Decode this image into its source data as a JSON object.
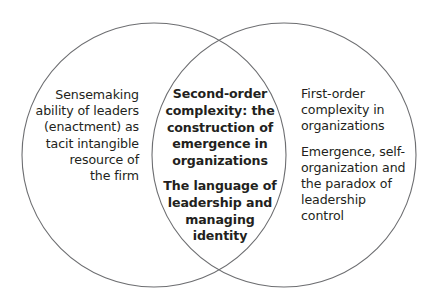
{
  "diagram": {
    "type": "venn",
    "circles": [
      {
        "id": "left",
        "cx": 154,
        "cy": 155,
        "r": 132
      },
      {
        "id": "right",
        "cx": 284,
        "cy": 155,
        "r": 132
      }
    ],
    "stroke_color": "#6d6e71",
    "left_only": {
      "paragraphs": [
        "Sensemaking\nability of leaders\n(enactment) as\ntacit intangible\nresource of\nthe firm"
      ]
    },
    "intersection": {
      "paragraphs": [
        "Second-order\ncomplexity: the\nconstruction of\nemergence in\norganizations",
        "The language of\nleadership and\nmanaging\nidentity"
      ]
    },
    "right_only": {
      "paragraphs": [
        "First-order\ncomplexity in\norganizations",
        "Emergence, self-\norganization and\nthe paradox of\nleadership\ncontrol"
      ]
    }
  }
}
